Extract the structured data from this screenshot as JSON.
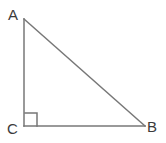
{
  "figure": {
    "kind": "right-triangle-diagram",
    "background_color": "#ffffff",
    "stroke_color": "#777777",
    "label_color": "#3b3b3b",
    "stroke_width": 1.5,
    "canvas": {
      "width": 166,
      "height": 143
    }
  },
  "labels": {
    "vertex_a": "A",
    "vertex_b": "B",
    "vertex_c": "C"
  },
  "geometry": {
    "points": {
      "A": {
        "x": 24,
        "y": 19
      },
      "B": {
        "x": 145,
        "y": 126
      },
      "C": {
        "x": 24,
        "y": 126
      }
    },
    "sides": [
      {
        "name": "leg-AC",
        "from": "A",
        "to": "C"
      },
      {
        "name": "leg-CB",
        "from": "C",
        "to": "B"
      },
      {
        "name": "hypotenuse-AB",
        "from": "A",
        "to": "B"
      }
    ],
    "right_angle_marker": {
      "at_vertex": "C",
      "x": 25,
      "y": 113,
      "size": 12
    }
  }
}
